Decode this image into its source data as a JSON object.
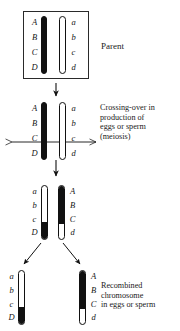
{
  "figure": {
    "ink_color": "#111111",
    "paper_color": "#ffffff"
  },
  "captions": {
    "parent": "Parent",
    "crossing_over": "Crossing-over in\nproduction of\neggs or sperm\n(meiosis)",
    "recombined": "Recombined\nchromosome\nin eggs or sperm"
  },
  "stages": [
    {
      "id": "parent",
      "name": "Parent cell",
      "caption": "Parent",
      "boxed": true,
      "chromosomes": [
        {
          "id": "parent-maternal",
          "fill": "black",
          "alleles": [
            "A",
            "B",
            "C",
            "D"
          ],
          "label_side": "left"
        },
        {
          "id": "parent-paternal",
          "fill": "white",
          "alleles": [
            "a",
            "b",
            "c",
            "d"
          ],
          "label_side": "right"
        }
      ]
    },
    {
      "id": "meiosis",
      "name": "Crossing-over during meiosis",
      "caption": "Crossing-over in production of eggs or sperm (meiosis)",
      "boxed": false,
      "crossover_marker": "double-headed-arrow",
      "crossover_between": [
        "C",
        "D"
      ],
      "chromosomes": [
        {
          "id": "meiosis-maternal",
          "fill": "black",
          "alleles": [
            "A",
            "B",
            "C",
            "D"
          ],
          "label_side": "left"
        },
        {
          "id": "meiosis-paternal",
          "fill": "white",
          "alleles": [
            "a",
            "b",
            "c",
            "d"
          ],
          "label_side": "right"
        }
      ]
    },
    {
      "id": "recombinants",
      "name": "Recombinant chromosomes",
      "caption": "",
      "boxed": false,
      "chromosomes": [
        {
          "id": "recombinant-left",
          "fill": "white-with-black-tip",
          "black_fraction_bottom": 0.33,
          "alleles": [
            "a",
            "b",
            "c",
            "D"
          ],
          "label_side": "left"
        },
        {
          "id": "recombinant-right",
          "fill": "black-with-white-tip",
          "black_fraction_top": 0.72,
          "alleles": [
            "A",
            "B",
            "C",
            "d"
          ],
          "label_side": "right"
        }
      ]
    },
    {
      "id": "gametes",
      "name": "Recombined chromosomes in gametes",
      "caption": "Recombined chromosome in eggs or sperm",
      "boxed": false,
      "chromosomes": [
        {
          "id": "gamete-left",
          "fill": "white-with-black-tip",
          "black_fraction_bottom": 0.33,
          "alleles": [
            "a",
            "b",
            "c",
            "D"
          ],
          "label_side": "left"
        },
        {
          "id": "gamete-right",
          "fill": "black-with-white-tip",
          "black_fraction_top": 0.72,
          "alleles": [
            "A",
            "B",
            "C",
            "d"
          ],
          "label_side": "right"
        }
      ]
    }
  ],
  "alleles": {
    "parent_left": [
      "A",
      "B",
      "C",
      "D"
    ],
    "parent_right": [
      "a",
      "b",
      "c",
      "d"
    ],
    "meiosis_left": [
      "A",
      "B",
      "C",
      "D"
    ],
    "meiosis_right": [
      "a",
      "b",
      "c",
      "d"
    ],
    "recomb_left": [
      "a",
      "b",
      "c",
      "D"
    ],
    "recomb_right": [
      "A",
      "B",
      "C",
      "d"
    ],
    "gamete_left": [
      "a",
      "b",
      "c",
      "D"
    ],
    "gamete_right": [
      "A",
      "B",
      "C",
      "d"
    ]
  },
  "arrows": [
    {
      "id": "arrow-parent-to-meiosis",
      "type": "down",
      "from": "parent",
      "to": "meiosis"
    },
    {
      "id": "arrow-meiosis-to-recombinants",
      "type": "down",
      "from": "meiosis",
      "to": "recombinants"
    },
    {
      "id": "arrow-crossover",
      "type": "double-headed-horizontal",
      "at": "meiosis"
    },
    {
      "id": "arrow-recomb-left-to-gamete",
      "type": "diagonal-down-left",
      "from": "recombinants",
      "to": "gametes"
    },
    {
      "id": "arrow-recomb-right-to-gamete",
      "type": "diagonal-down-right",
      "from": "recombinants",
      "to": "gametes"
    }
  ]
}
